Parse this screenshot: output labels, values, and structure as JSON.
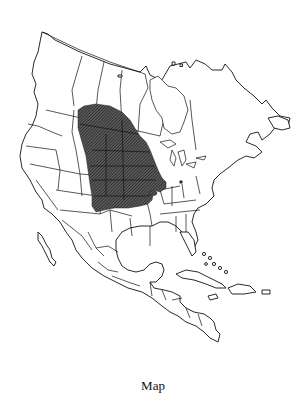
{
  "figure": {
    "caption": "Map",
    "legend": {
      "range_fill": "hatched dark gray",
      "range_color": "#4a4a4a"
    },
    "range_region": {
      "label": "Species range",
      "description": "Great Plains from southern Alberta/Saskatchewan/Manitoba south through the Dakotas, Nebraska, Kansas to Oklahoma/northern Texas panhandle, east to Iowa/Minnesota/Wisconsin-Illinois border; small isolated patches in Missouri/Illinois and Ohio"
    },
    "colors": {
      "background": "#ffffff",
      "outline": "#111111",
      "range": "#4a4a4a"
    }
  }
}
